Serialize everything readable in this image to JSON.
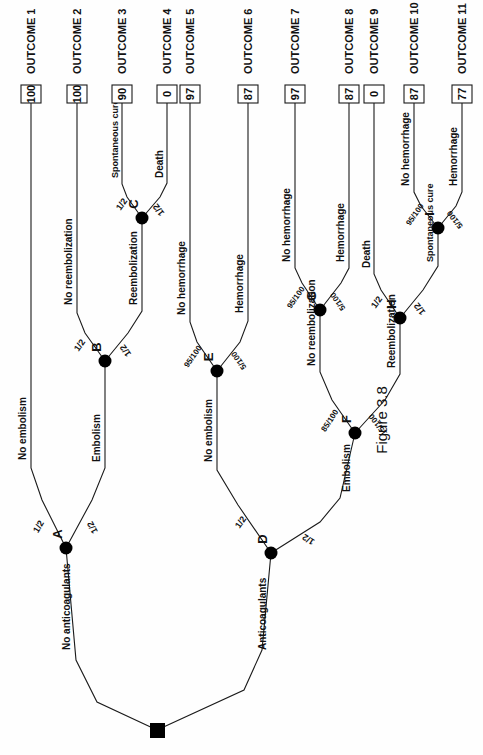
{
  "figure": {
    "caption": "Figure 3.8"
  },
  "root": {
    "id": "root",
    "label": "",
    "shape": "square"
  },
  "nodes": [
    {
      "id": "A",
      "label": "A",
      "shape": "circle"
    },
    {
      "id": "B",
      "label": "B",
      "shape": "circle"
    },
    {
      "id": "C",
      "label": "C",
      "shape": "circle"
    },
    {
      "id": "D",
      "label": "D",
      "shape": "circle"
    },
    {
      "id": "E",
      "label": "E",
      "shape": "circle"
    },
    {
      "id": "F",
      "label": "F",
      "shape": "circle"
    },
    {
      "id": "G",
      "label": "G",
      "shape": "circle"
    },
    {
      "id": "H",
      "label": "H",
      "shape": "circle"
    },
    {
      "id": "I",
      "label": "I",
      "shape": "circle"
    }
  ],
  "branches": {
    "root_left": {
      "label": "No anticoagulants",
      "prob": ""
    },
    "root_right": {
      "label": "Anticoagulants",
      "prob": ""
    },
    "a_left": {
      "label": "No embolism",
      "prob": "1/2"
    },
    "a_right": {
      "label": "Embolism",
      "prob": "1/2"
    },
    "b_left": {
      "label": "No reembolization",
      "prob": "1/2"
    },
    "b_right": {
      "label": "Reembolization",
      "prob": "1/2"
    },
    "c_left": {
      "label": "Spontaneous cure",
      "prob": "1/2"
    },
    "c_right": {
      "label": "Death",
      "prob": "1/2"
    },
    "d_left": {
      "label": "No embolism",
      "prob": "1/2"
    },
    "d_right": {
      "label": "Embolism",
      "prob": "1/2"
    },
    "e_left": {
      "label": "No hemorrhage",
      "prob": "95/100"
    },
    "e_right": {
      "label": "Hemorrhage",
      "prob": "5/100"
    },
    "f_left": {
      "label": "No reembolization",
      "prob": "85/100"
    },
    "f_right": {
      "label": "Reembolization",
      "prob": "15/100"
    },
    "g_left": {
      "label": "No hemorrhage",
      "prob": "95/100"
    },
    "g_right": {
      "label": "Hemorrhage",
      "prob": "5/100"
    },
    "h_left": {
      "label": "Death",
      "prob": "1/2"
    },
    "h_right": {
      "label": "Spontaneous cure",
      "prob": "1/2"
    },
    "i_left": {
      "label": "No hemorrhage",
      "prob": "95/100"
    },
    "i_right": {
      "label": "Hemorrhage",
      "prob": "5/100"
    }
  },
  "outcomes": [
    {
      "name": "OUTCOME 1",
      "value": "100"
    },
    {
      "name": "OUTCOME 2",
      "value": "100"
    },
    {
      "name": "OUTCOME 3",
      "value": "90"
    },
    {
      "name": "OUTCOME 4",
      "value": "0"
    },
    {
      "name": "OUTCOME 5",
      "value": "97"
    },
    {
      "name": "OUTCOME 6",
      "value": "87"
    },
    {
      "name": "OUTCOME 7",
      "value": "97"
    },
    {
      "name": "OUTCOME 8",
      "value": "87"
    },
    {
      "name": "OUTCOME 9",
      "value": "0"
    },
    {
      "name": "OUTCOME 10",
      "value": "87"
    },
    {
      "name": "OUTCOME 11",
      "value": "77"
    }
  ],
  "colors": {
    "ink": "#1a1a1a",
    "paper": "#ffffff",
    "node": "#000000"
  }
}
